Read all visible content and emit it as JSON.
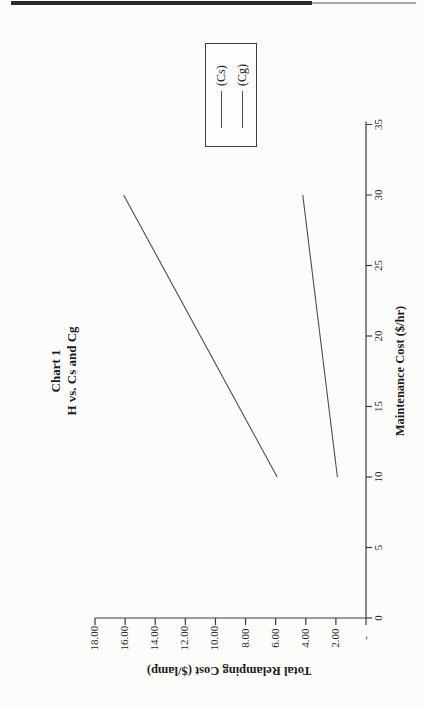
{
  "colors": {
    "axis": "#3b3b3b",
    "series_line": "#4d4d4d",
    "text": "#1c1c1c",
    "top_rule_dark": "#2b2b2b",
    "top_rule_light": "#a9a9a6"
  },
  "chart_data": {
    "type": "line",
    "title": "Chart 1",
    "subtitle": "H vs. Cs and Cg",
    "xlabel": "Maintenance Cost ($/hr)",
    "ylabel": "Total Relamping Cost ($/lamp)",
    "xlim": [
      0,
      35
    ],
    "ylim": [
      0,
      18
    ],
    "grid": false,
    "legend_position": "right",
    "orientation_note": "landscape chart rotated 90 degrees counterclockwise on portrait page",
    "x_ticks": [
      {
        "v": 0,
        "label": "0"
      },
      {
        "v": 5,
        "label": "5"
      },
      {
        "v": 10,
        "label": "10"
      },
      {
        "v": 15,
        "label": "15"
      },
      {
        "v": 20,
        "label": "20"
      },
      {
        "v": 25,
        "label": "25"
      },
      {
        "v": 30,
        "label": "30"
      },
      {
        "v": 35,
        "label": "35"
      }
    ],
    "y_ticks": [
      {
        "v": 18,
        "label": "18.00"
      },
      {
        "v": 16,
        "label": "16.00"
      },
      {
        "v": 14,
        "label": "14.00"
      },
      {
        "v": 12,
        "label": "12.00"
      },
      {
        "v": 10,
        "label": "10.00"
      },
      {
        "v": 8,
        "label": "8.00"
      },
      {
        "v": 6,
        "label": "6.00"
      },
      {
        "v": 4,
        "label": "4.00"
      },
      {
        "v": 2,
        "label": "2.00"
      },
      {
        "v": 0,
        "label": "-"
      }
    ],
    "series": [
      {
        "name": "(Cs)",
        "points": [
          {
            "x": 10,
            "y": 5.9
          },
          {
            "x": 30,
            "y": 16.1
          }
        ]
      },
      {
        "name": "(Cg)",
        "points": [
          {
            "x": 10,
            "y": 1.9
          },
          {
            "x": 30,
            "y": 4.2
          }
        ]
      }
    ]
  }
}
